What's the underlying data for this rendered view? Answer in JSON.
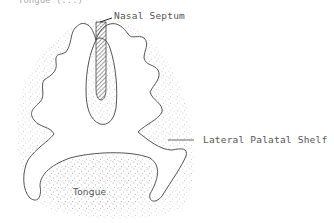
{
  "figure": {
    "type": "anatomical cross-section diagram",
    "top_clipped_text": "Tongue (...)",
    "labels": {
      "nasal_septum": "Nasal Septum",
      "lateral_palatal_shelf": "Lateral Palatal Shelf",
      "tongue": "Tongue"
    },
    "colors": {
      "outline": "#555555",
      "stipple": "#9a9a9a",
      "hatch": "#444444",
      "text": "#555555"
    }
  }
}
